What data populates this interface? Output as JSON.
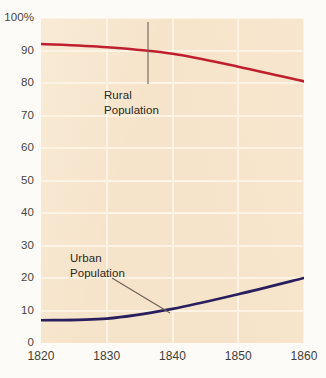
{
  "chart_data": {
    "type": "line",
    "title": "",
    "xlabel": "",
    "ylabel": "",
    "xlim": [
      1820,
      1860
    ],
    "ylim": [
      0,
      100
    ],
    "grid": true,
    "legend_position": "inline-annotations",
    "x": [
      1820,
      1830,
      1840,
      1850,
      1860
    ],
    "categories": [
      "1820",
      "1830",
      "1840",
      "1850",
      "1860"
    ],
    "x_tick_labels": [
      "1820",
      "1830",
      "1840",
      "1850",
      "1860"
    ],
    "y_tick_labels": [
      "0",
      "10",
      "20",
      "30",
      "40",
      "50",
      "60",
      "70",
      "80",
      "90",
      "100%"
    ],
    "y_ticks": [
      0,
      10,
      20,
      30,
      40,
      50,
      60,
      70,
      80,
      90,
      100
    ],
    "series": [
      {
        "name": "Rural Population",
        "color": "#c0202e",
        "values": [
          92.0,
          91.0,
          89.0,
          85.0,
          80.5
        ]
      },
      {
        "name": "Urban Population",
        "color": "#2a1f5e",
        "values": [
          7.0,
          7.5,
          10.5,
          15.0,
          20.0
        ]
      }
    ],
    "annotations": [
      {
        "text": "Rural\nPopulation",
        "series": "Rural Population"
      },
      {
        "text": "Urban\nPopulation",
        "series": "Urban Population"
      }
    ]
  },
  "colors": {
    "plot_background": "#f6e4ca",
    "page_background": "#fdfbf7",
    "gridline": "#fdf3e4",
    "rural_line": "#c0202e",
    "urban_line": "#2a1f5e",
    "leader_line": "#6b6156",
    "tick_label": "#413d38"
  }
}
